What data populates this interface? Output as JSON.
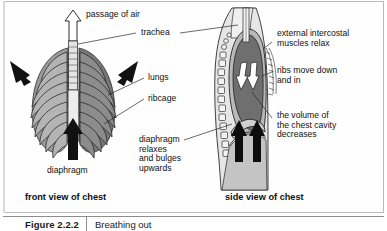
{
  "figure": {
    "number": "Figure 2.2.2",
    "caption": "Breathing out"
  },
  "views": {
    "front_title": "front view of chest",
    "side_title": "side view of chest"
  },
  "labels": {
    "passage_of_air": "passage of air",
    "trachea": "trachea",
    "lungs": "lungs",
    "ribcage": "ribcage",
    "diaphragm": "diaphragm",
    "diaphragm_relaxes": "diaphragm\nrelaxes\nand bulges\nupwards",
    "intercostal": "external intercostal\nmuscles relax",
    "ribs_move": "ribs move down\nand in",
    "volume_decreases": "the volume of\nthe chest cavity\ndecreases"
  },
  "icons": {
    "air_arrow": "up-arrow-outline-icon",
    "squeeze_arrow_left": "inward-arrow-icon",
    "squeeze_arrow_right": "inward-arrow-icon",
    "diaphragm_arrow_front": "up-arrow-solid-icon",
    "diaphragm_arrow_side_a": "up-arrow-solid-icon",
    "diaphragm_arrow_side_b": "up-arrow-solid-icon",
    "lung_arrow_side_a": "up-arrow-outline-icon",
    "lung_arrow_side_b": "up-arrow-outline-icon"
  },
  "colors": {
    "ink": "#1a1a1a",
    "rib_fill": "#8d8d8d",
    "rib_fill_light": "#c9c9c9",
    "lung_dark": "#6f6f6f",
    "body_light": "#d8d8d8",
    "body_lighter": "#e9e9e9",
    "panel_border": "#b9b9b9",
    "white": "#ffffff"
  }
}
